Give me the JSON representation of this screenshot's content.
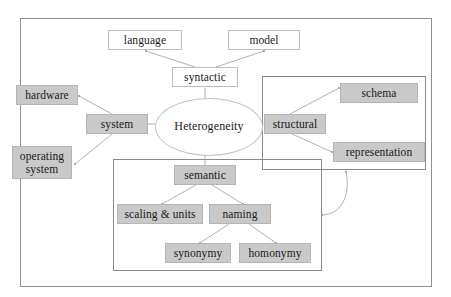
{
  "diagram": {
    "colors": {
      "node_fill_gray": "#c9c9c9",
      "node_fill_white": "#ffffff",
      "border_gray": "#b5b5b5",
      "frame_gray": "#8e8e8e",
      "connector_gray": "#a8a8a8",
      "text": "#1a1a1a"
    },
    "center": {
      "label": "Heterogeneity",
      "shape": "ellipse",
      "fill": "white"
    },
    "nodes": [
      {
        "id": "language",
        "label": "language",
        "fill": "white"
      },
      {
        "id": "model",
        "label": "model",
        "fill": "white"
      },
      {
        "id": "syntactic",
        "label": "syntactic",
        "fill": "white"
      },
      {
        "id": "hardware",
        "label": "hardware",
        "fill": "gray"
      },
      {
        "id": "system",
        "label": "system",
        "fill": "gray"
      },
      {
        "id": "operating",
        "label": "operating\nsystem",
        "fill": "gray"
      },
      {
        "id": "structural",
        "label": "structural",
        "fill": "gray"
      },
      {
        "id": "schema",
        "label": "schema",
        "fill": "gray"
      },
      {
        "id": "representation",
        "label": "representation",
        "fill": "gray"
      },
      {
        "id": "semantic",
        "label": "semantic",
        "fill": "gray"
      },
      {
        "id": "scaling",
        "label": "scaling & units",
        "fill": "gray"
      },
      {
        "id": "naming",
        "label": "naming",
        "fill": "gray"
      },
      {
        "id": "synonymy",
        "label": "synonymy",
        "fill": "gray"
      },
      {
        "id": "homonymy",
        "label": "homonymy",
        "fill": "gray"
      }
    ],
    "edges": [
      {
        "from": "syntactic",
        "to": "language"
      },
      {
        "from": "syntactic",
        "to": "model"
      },
      {
        "from": "system",
        "to": "hardware"
      },
      {
        "from": "system",
        "to": "operating"
      },
      {
        "from": "structural",
        "to": "schema"
      },
      {
        "from": "structural",
        "to": "representation"
      },
      {
        "from": "semantic",
        "to": "scaling"
      },
      {
        "from": "semantic",
        "to": "naming"
      },
      {
        "from": "naming",
        "to": "synonymy"
      },
      {
        "from": "naming",
        "to": "homonymy"
      },
      {
        "from": "heterogeneity",
        "to": "syntactic"
      },
      {
        "from": "heterogeneity",
        "to": "system"
      },
      {
        "from": "heterogeneity",
        "to": "structural"
      },
      {
        "from": "heterogeneity",
        "to": "semantic"
      }
    ],
    "groups": [
      {
        "id": "structural-group",
        "members": [
          "structural",
          "schema",
          "representation"
        ]
      },
      {
        "id": "semantic-group",
        "members": [
          "semantic",
          "scaling",
          "naming",
          "synonymy",
          "homonymy"
        ]
      }
    ]
  }
}
